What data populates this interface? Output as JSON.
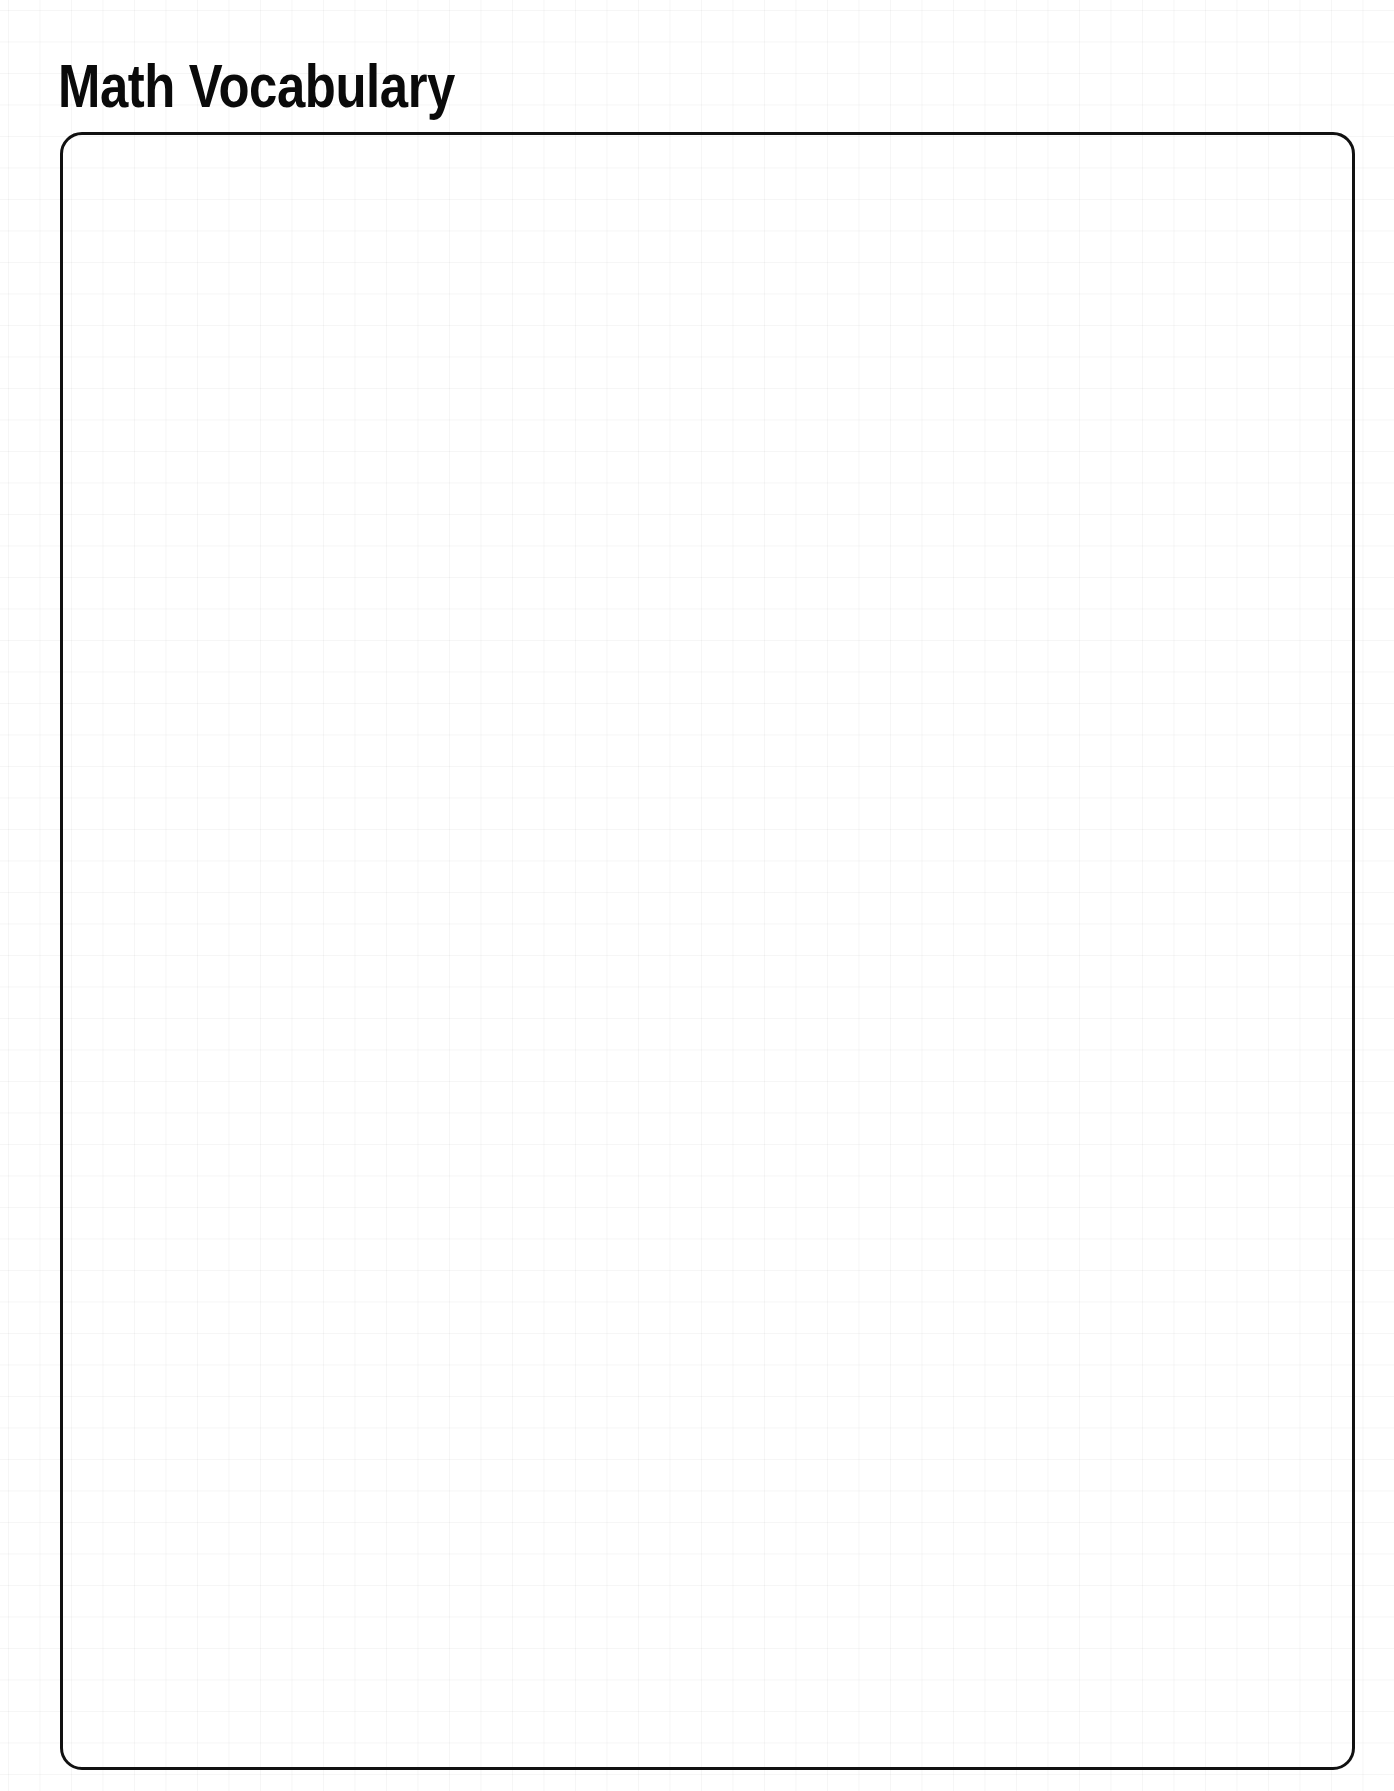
{
  "page": {
    "title": "Math Vocabulary"
  },
  "answer_box": {
    "content": ""
  },
  "colors": {
    "text": "#0a0a0a",
    "border": "#111111",
    "background": "#ffffff",
    "grid": "#f6f6f6"
  }
}
